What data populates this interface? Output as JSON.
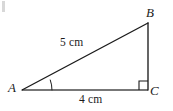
{
  "figure": {
    "type": "right-triangle-diagram",
    "background_color": "#ffffff",
    "stroke_color": "#1b1b1b",
    "base_stroke_color": "#4a4a4a",
    "vertices": [
      {
        "id": "A",
        "label": "A",
        "x": 22,
        "y": 90
      },
      {
        "id": "B",
        "label": "B",
        "x": 148,
        "y": 23
      },
      {
        "id": "C",
        "label": "C",
        "x": 148,
        "y": 90
      }
    ],
    "sides": [
      {
        "id": "AB",
        "from": "A",
        "to": "B",
        "label": "5 cm",
        "role": "hypotenuse"
      },
      {
        "id": "AC",
        "from": "A",
        "to": "C",
        "label": "4 cm",
        "role": "base"
      },
      {
        "id": "BC",
        "from": "B",
        "to": "C",
        "label": "",
        "role": "vertical-leg"
      }
    ],
    "marks": [
      {
        "id": "right-angle-C",
        "kind": "right-angle-square",
        "at": "C",
        "size": 9
      },
      {
        "id": "angle-arc-A",
        "kind": "angle-arc",
        "at": "A",
        "radius": 30
      }
    ],
    "artifact": {
      "kind": "scan-speck",
      "x": 2,
      "y": 1,
      "width": 3,
      "height": 11
    }
  }
}
